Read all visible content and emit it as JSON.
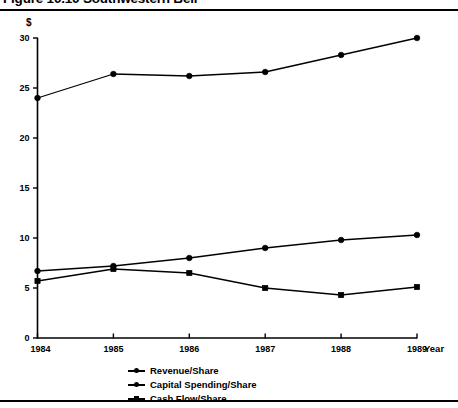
{
  "figure": {
    "title": "Figure 10.10  Southwestern Bell",
    "currency_symbol": "$",
    "year_axis_label": "Year"
  },
  "chart_data": {
    "type": "line",
    "title": "Figure 10.10  Southwestern Bell",
    "xlabel": "Year",
    "ylabel": "$",
    "categories": [
      "1984",
      "1985",
      "1986",
      "1987",
      "1988",
      "1989"
    ],
    "x": [
      1984,
      1985,
      1986,
      1987,
      1988,
      1989
    ],
    "xlim": [
      1984,
      1989
    ],
    "ylim": [
      0,
      30
    ],
    "yticks": [
      "0",
      "5",
      "10",
      "15",
      "20",
      "25",
      "30"
    ],
    "ytick_values": [
      0,
      5,
      10,
      15,
      20,
      25,
      30
    ],
    "grid": false,
    "legend_position": "bottom",
    "series": [
      {
        "name": "Revenue/Share",
        "marker": "circle",
        "values": [
          24.0,
          26.4,
          26.2,
          26.6,
          28.3,
          30.0
        ]
      },
      {
        "name": "Capital Spending/Share",
        "marker": "circle",
        "values": [
          6.7,
          7.2,
          8.0,
          9.0,
          9.8,
          10.3
        ]
      },
      {
        "name": "Cash Flow/Share",
        "marker": "square",
        "values": [
          5.7,
          6.9,
          6.5,
          5.0,
          4.3,
          5.1
        ]
      }
    ]
  },
  "legend": {
    "items": [
      {
        "label": "Revenue/Share",
        "marker": "circle"
      },
      {
        "label": "Capital Spending/Share",
        "marker": "circle"
      },
      {
        "label": "Cash Flow/Share",
        "marker": "square"
      }
    ]
  },
  "colors": {
    "ink": "#000000",
    "background": "#ffffff"
  }
}
